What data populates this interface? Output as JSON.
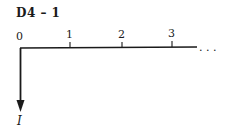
{
  "diagram": {
    "title": "D4 – 1",
    "type": "cash-flow timeline",
    "axis": {
      "ticks": [
        {
          "label": "0",
          "x": 20
        },
        {
          "label": "1",
          "x": 70
        },
        {
          "label": "2",
          "x": 122
        },
        {
          "label": "3",
          "x": 172
        }
      ],
      "continuation": ". . ."
    },
    "arrows": [
      {
        "at_period": "0",
        "direction": "down",
        "label": "I"
      }
    ]
  }
}
